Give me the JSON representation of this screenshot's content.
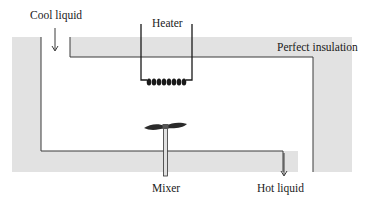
{
  "diagram": {
    "labels": {
      "inlet": "Cool liquid",
      "heater": "Heater",
      "insulation": "Perfect insulation",
      "mixer": "Mixer",
      "outlet": "Hot liquid"
    },
    "colors": {
      "insulation_fill": "#e2e2e2",
      "line": "#3a3a3a",
      "coil": "#1a1a1a",
      "background": "#ffffff"
    },
    "flows": [
      {
        "name": "inlet",
        "direction": "down",
        "label": "Cool liquid"
      },
      {
        "name": "outlet",
        "direction": "down",
        "label": "Hot liquid"
      }
    ]
  }
}
